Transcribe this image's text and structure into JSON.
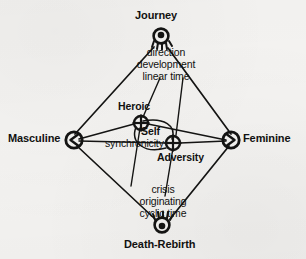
{
  "figure": {
    "type": "concept-diagram",
    "background_color": "#f4f3f1",
    "ink_color": "#111110"
  },
  "axis_nodes": [
    {
      "id": "journey",
      "label": "Journey",
      "glyph": "sun-rays-down-icon",
      "position": "top"
    },
    {
      "id": "masculine",
      "label": "Masculine",
      "glyph": "circle-arrow-left-icon",
      "position": "left"
    },
    {
      "id": "feminine",
      "label": "Feminine",
      "glyph": "circle-arrow-right-icon",
      "position": "right"
    },
    {
      "id": "death-rebirth",
      "label": "Death-Rebirth",
      "glyph": "sun-rays-up-icon",
      "position": "bottom"
    }
  ],
  "inner_nodes": [
    {
      "id": "heroic",
      "label": "Heroic",
      "glyph": "crossed-circle-icon"
    },
    {
      "id": "adversity",
      "label": "Adversity",
      "glyph": "crossed-circle-icon"
    }
  ],
  "center_labels": [
    {
      "id": "self",
      "label": "Self"
    },
    {
      "id": "synchronicity",
      "label": "synchronicity"
    }
  ],
  "attribute_groups": [
    {
      "id": "journey-attributes",
      "belongs_to": "journey",
      "lines": [
        "direction",
        "development",
        "linear time"
      ]
    },
    {
      "id": "death-rebirth-attributes",
      "belongs_to": "death-rebirth",
      "lines": [
        "crisis",
        "originating",
        "cyclic time"
      ]
    }
  ],
  "edges": [
    {
      "from": "journey",
      "to": "masculine"
    },
    {
      "from": "journey",
      "to": "feminine"
    },
    {
      "from": "masculine",
      "to": "death-rebirth"
    },
    {
      "from": "feminine",
      "to": "death-rebirth"
    },
    {
      "from": "masculine",
      "to": "heroic"
    },
    {
      "from": "masculine",
      "to": "adversity"
    },
    {
      "from": "feminine",
      "to": "heroic"
    },
    {
      "from": "feminine",
      "to": "adversity"
    },
    {
      "from": "journey",
      "to": "heroic"
    },
    {
      "from": "journey",
      "to": "adversity"
    },
    {
      "from": "heroic",
      "to": "death-rebirth"
    },
    {
      "from": "adversity",
      "to": "death-rebirth"
    },
    {
      "from": "heroic",
      "to": "adversity",
      "style": "arc"
    }
  ]
}
